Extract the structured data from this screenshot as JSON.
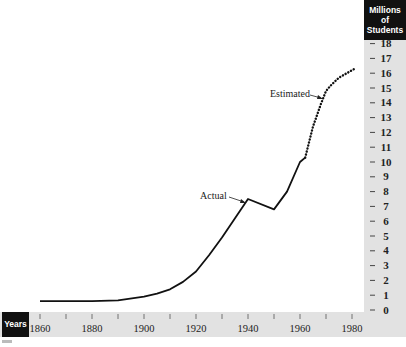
{
  "chart_data": {
    "type": "line",
    "title": "",
    "xlabel": "Years",
    "ylabel": "Millions of Students",
    "ylabel_lines": [
      "Millions",
      "of",
      "Students"
    ],
    "xlim": [
      1860,
      1980
    ],
    "ylim": [
      0,
      18
    ],
    "x_ticks": [
      1860,
      1870,
      1880,
      1890,
      1900,
      1910,
      1920,
      1930,
      1940,
      1950,
      1960,
      1970,
      1980
    ],
    "x_tick_labels": [
      "1860",
      "1880",
      "1900",
      "1920",
      "1940",
      "1960",
      "1980"
    ],
    "y_ticks": [
      0,
      1,
      2,
      3,
      4,
      5,
      6,
      7,
      8,
      9,
      10,
      11,
      12,
      13,
      14,
      15,
      16,
      17,
      18
    ],
    "grid": false,
    "series": [
      {
        "name": "Actual",
        "style": "solid",
        "x": [
          1860,
          1870,
          1880,
          1890,
          1900,
          1905,
          1910,
          1915,
          1920,
          1925,
          1930,
          1935,
          1940,
          1950,
          1955,
          1960,
          1962
        ],
        "values": [
          0.6,
          0.6,
          0.6,
          0.65,
          0.9,
          1.1,
          1.4,
          1.9,
          2.6,
          3.7,
          4.9,
          6.2,
          7.5,
          6.8,
          8.0,
          10.0,
          10.3
        ]
      },
      {
        "name": "Estimated",
        "style": "dotted",
        "x": [
          1962,
          1965,
          1968,
          1970,
          1972,
          1975,
          1978,
          1981
        ],
        "values": [
          10.3,
          12.4,
          13.9,
          14.8,
          15.2,
          15.7,
          16.0,
          16.3
        ]
      }
    ],
    "annotations": [
      {
        "text": "Actual",
        "points_to_year": 1940,
        "points_to_value": 7.5
      },
      {
        "text": "Estimated",
        "points_to_year": 1967,
        "points_to_value": 13.5
      }
    ],
    "colors": {
      "line": "#111111",
      "axis_band": "#e2e2e2",
      "label_box": "#111111"
    }
  }
}
